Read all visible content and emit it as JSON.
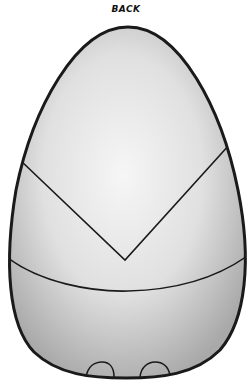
{
  "title": "BACK",
  "figure": {
    "outline_color": "#1a1a1a",
    "fill_light": "#f4f4f4",
    "fill_dark": "#b8b8b8",
    "panels": [
      "upper-panel",
      "v-band",
      "lower-band",
      "base"
    ],
    "feet": 2
  }
}
